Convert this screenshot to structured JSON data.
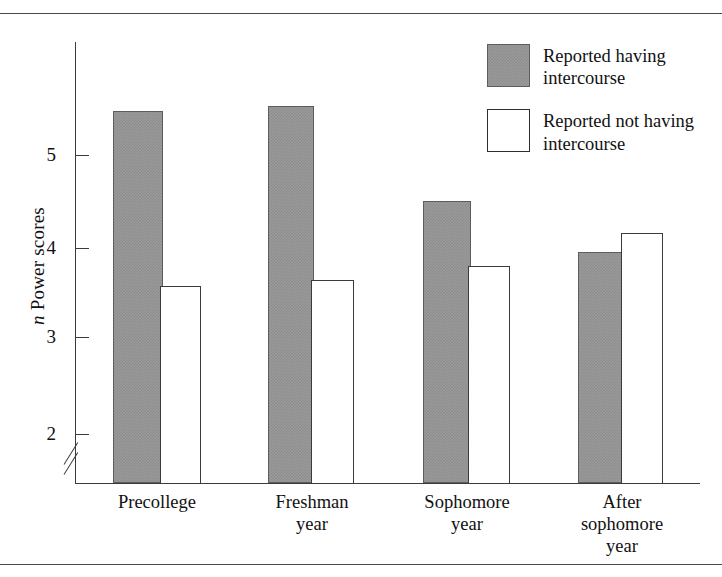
{
  "figure": {
    "top_caption_fragment": "",
    "rules": {
      "top": true,
      "bottom": true
    }
  },
  "legend": {
    "items": [
      {
        "label": "Reported having intercourse",
        "swatch": "filled-gray-swatch",
        "color": "#9b9b9b"
      },
      {
        "label": "Reported not having intercourse",
        "swatch": "open-white-swatch",
        "color": "#ffffff"
      }
    ]
  },
  "axes": {
    "y": {
      "label_prefix": "n",
      "label_rest": " Power scores",
      "ticks": [
        "5",
        "4",
        "3",
        "2"
      ],
      "has_break": true
    },
    "x": {
      "categories": [
        "Precollege",
        "Freshman\nyear",
        "Sophomore\nyear",
        "After\nsophomore\nyear"
      ]
    }
  },
  "chart_data": {
    "type": "bar",
    "title": "",
    "xlabel": "",
    "ylabel": "n Power scores",
    "categories": [
      "Precollege",
      "Freshman year",
      "Sophomore year",
      "After sophomore year"
    ],
    "series": [
      {
        "name": "Reported having intercourse",
        "color": "#9b9b9b",
        "values": [
          5.42,
          5.46,
          4.51,
          3.96
        ]
      },
      {
        "name": "Reported not having intercourse",
        "color": "#ffffff",
        "values": [
          3.56,
          3.63,
          3.79,
          4.16
        ]
      }
    ],
    "ylim": [
      1.6,
      5.9
    ],
    "yticks": [
      2,
      3,
      4,
      5
    ],
    "y_axis_break": true,
    "grid": false,
    "legend_position": "top-right"
  }
}
